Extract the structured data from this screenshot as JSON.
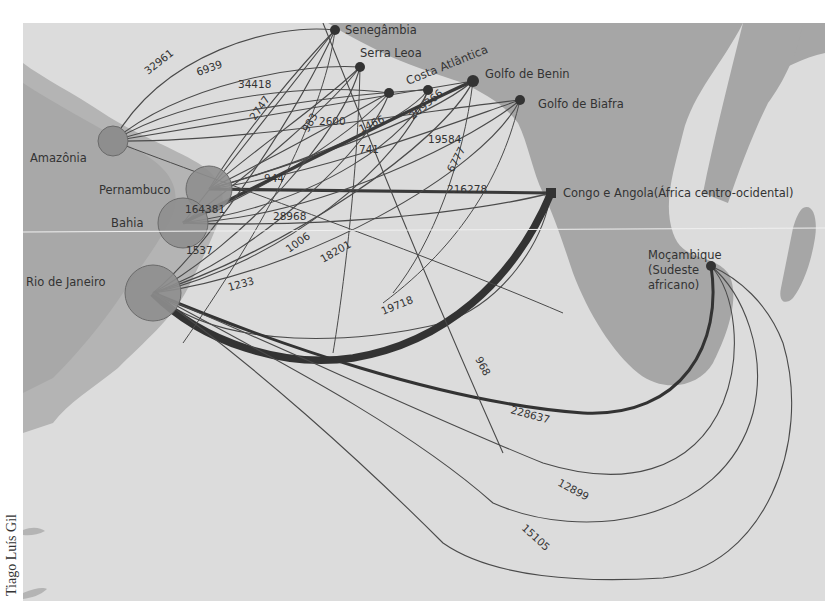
{
  "credit": "Tiago Luís Gil",
  "colors": {
    "ocean": "#dcdcdc",
    "land": "#a9a9a9",
    "brazil_land": "#b8b8b8",
    "port_circle": "#8c8c8c",
    "node": "#333333",
    "flow": "#4a4a4a"
  },
  "origins_africa": [
    {
      "id": "senegambia",
      "label": "Senegâmbia"
    },
    {
      "id": "serra_leoa",
      "label": "Serra Leoa"
    },
    {
      "id": "costa_atlantica",
      "label": "Costa Atlântica"
    },
    {
      "id": "golfo_benin",
      "label": "Golfo de Benin"
    },
    {
      "id": "golfo_biafra",
      "label": "Golfo de Biafra"
    },
    {
      "id": "congo_angola",
      "label": "Congo e Angola(África centro-ocidental)"
    },
    {
      "id": "mocambique",
      "label_lines": [
        "Moçambique",
        "(Sudeste",
        "africano)"
      ]
    }
  ],
  "destinations_brazil": [
    {
      "id": "amazonia",
      "label": "Amazônia"
    },
    {
      "id": "pernambuco",
      "label": "Pernambuco"
    },
    {
      "id": "bahia",
      "label": "Bahia"
    },
    {
      "id": "rio",
      "label": "Rio de Janeiro"
    }
  ],
  "flow_labels": {
    "f32961": "32961",
    "f6939": "6939",
    "f34418": "34418",
    "f2747": "2747",
    "f983": "983",
    "f2600": "2600",
    "f1466": "1466",
    "f209366": "209366",
    "f19584": "19584",
    "f741": "741",
    "f944": "944",
    "f6777": "6777",
    "f216278": "216278",
    "f164381": "164381",
    "f28968": "28968",
    "f1537": "1537",
    "f1006": "1006",
    "f18201": "18201",
    "f1233": "1233",
    "f19718": "19718",
    "f968": "968",
    "f228637": "228637",
    "f12899": "12899",
    "f15105": "15105"
  }
}
